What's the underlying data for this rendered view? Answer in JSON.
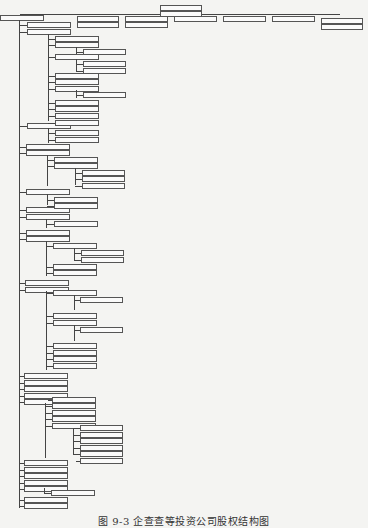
{
  "diagram": {
    "type": "tree",
    "caption": "图 9-3  企查查等投资公司股权结构图",
    "colors": {
      "line": "#444444",
      "box_border": "#555555",
      "box_fill": "#fafafa",
      "background": "#f4f4f2"
    },
    "top_row": {
      "root": {
        "x": 0,
        "y": 15,
        "w": 42
      },
      "spine": {
        "x": 20,
        "y": 14,
        "w": 320
      },
      "header_boxes": [
        {
          "x": 160,
          "y": 5,
          "w": 40
        },
        {
          "x": 160,
          "y": 11,
          "w": 40
        },
        {
          "x": 77,
          "y": 16,
          "w": 40
        },
        {
          "x": 77,
          "y": 22,
          "w": 40
        },
        {
          "x": 125,
          "y": 16,
          "w": 41
        },
        {
          "x": 125,
          "y": 22,
          "w": 41
        },
        {
          "x": 174,
          "y": 16,
          "w": 41
        },
        {
          "x": 223,
          "y": 16,
          "w": 41
        },
        {
          "x": 272,
          "y": 16,
          "w": 41
        },
        {
          "x": 321,
          "y": 18,
          "w": 40
        },
        {
          "x": 321,
          "y": 24,
          "w": 40
        }
      ]
    },
    "trunk": {
      "x": 19,
      "y1": 20,
      "y2": 508
    },
    "branches": [
      {
        "x": 27,
        "y": 22,
        "w": 42
      },
      {
        "x": 27,
        "y": 29,
        "w": 42
      },
      {
        "x": 27,
        "y": 123,
        "w": 42
      },
      {
        "x": 26,
        "y": 144,
        "w": 42
      },
      {
        "x": 26,
        "y": 150,
        "w": 42
      },
      {
        "x": 26,
        "y": 189,
        "w": 42
      },
      {
        "x": 26,
        "y": 207,
        "w": 42
      },
      {
        "x": 26,
        "y": 214,
        "w": 42
      },
      {
        "x": 26,
        "y": 230,
        "w": 42
      },
      {
        "x": 26,
        "y": 236,
        "w": 42
      },
      {
        "x": 25,
        "y": 280,
        "w": 42
      },
      {
        "x": 25,
        "y": 287,
        "w": 42
      },
      {
        "x": 24,
        "y": 373,
        "w": 42
      },
      {
        "x": 24,
        "y": 380,
        "w": 42
      },
      {
        "x": 24,
        "y": 386,
        "w": 42
      },
      {
        "x": 24,
        "y": 393,
        "w": 42
      },
      {
        "x": 24,
        "y": 399,
        "w": 42
      },
      {
        "x": 24,
        "y": 460,
        "w": 42
      },
      {
        "x": 24,
        "y": 467,
        "w": 42
      },
      {
        "x": 24,
        "y": 473,
        "w": 42
      },
      {
        "x": 24,
        "y": 480,
        "w": 42
      },
      {
        "x": 24,
        "y": 486,
        "w": 42
      },
      {
        "x": 24,
        "y": 497,
        "w": 42
      },
      {
        "x": 24,
        "y": 503,
        "w": 42
      }
    ],
    "sub_trunks": [
      {
        "x": 48,
        "y1": 34,
        "y2": 121
      },
      {
        "x": 48,
        "y1": 128,
        "y2": 143
      },
      {
        "x": 47,
        "y1": 155,
        "y2": 186
      },
      {
        "x": 47,
        "y1": 194,
        "y2": 205
      },
      {
        "x": 46,
        "y1": 219,
        "y2": 228
      },
      {
        "x": 46,
        "y1": 241,
        "y2": 276
      },
      {
        "x": 46,
        "y1": 291,
        "y2": 370
      },
      {
        "x": 45,
        "y1": 403,
        "y2": 458
      },
      {
        "x": 44,
        "y1": 488,
        "y2": 494
      }
    ],
    "level2": [
      {
        "x": 55,
        "y": 36,
        "w": 42
      },
      {
        "x": 55,
        "y": 42,
        "w": 42
      },
      {
        "x": 55,
        "y": 54,
        "w": 42
      },
      {
        "x": 55,
        "y": 73,
        "w": 42
      },
      {
        "x": 55,
        "y": 79,
        "w": 42
      },
      {
        "x": 55,
        "y": 86,
        "w": 42
      },
      {
        "x": 55,
        "y": 100,
        "w": 42
      },
      {
        "x": 55,
        "y": 106,
        "w": 42
      },
      {
        "x": 55,
        "y": 113,
        "w": 42
      },
      {
        "x": 55,
        "y": 120,
        "w": 42
      },
      {
        "x": 55,
        "y": 130,
        "w": 42
      },
      {
        "x": 55,
        "y": 137,
        "w": 42
      },
      {
        "x": 54,
        "y": 157,
        "w": 42
      },
      {
        "x": 54,
        "y": 163,
        "w": 42
      },
      {
        "x": 54,
        "y": 197,
        "w": 42
      },
      {
        "x": 54,
        "y": 203,
        "w": 42
      },
      {
        "x": 54,
        "y": 221,
        "w": 42
      },
      {
        "x": 53,
        "y": 243,
        "w": 42
      },
      {
        "x": 53,
        "y": 264,
        "w": 42
      },
      {
        "x": 53,
        "y": 270,
        "w": 42
      },
      {
        "x": 53,
        "y": 290,
        "w": 42
      },
      {
        "x": 53,
        "y": 313,
        "w": 42
      },
      {
        "x": 53,
        "y": 320,
        "w": 42
      },
      {
        "x": 53,
        "y": 343,
        "w": 42
      },
      {
        "x": 53,
        "y": 350,
        "w": 42
      },
      {
        "x": 53,
        "y": 356,
        "w": 42
      },
      {
        "x": 53,
        "y": 363,
        "w": 42
      },
      {
        "x": 52,
        "y": 397,
        "w": 42
      },
      {
        "x": 52,
        "y": 403,
        "w": 42
      },
      {
        "x": 52,
        "y": 410,
        "w": 42
      },
      {
        "x": 52,
        "y": 416,
        "w": 42
      },
      {
        "x": 52,
        "y": 423,
        "w": 42
      },
      {
        "x": 51,
        "y": 490,
        "w": 42
      }
    ],
    "level2_trunks": [
      {
        "x": 76,
        "y1": 47,
        "y2": 54
      },
      {
        "x": 76,
        "y1": 59,
        "y2": 71
      },
      {
        "x": 76,
        "y1": 90,
        "y2": 98
      },
      {
        "x": 75,
        "y1": 168,
        "y2": 185
      },
      {
        "x": 74,
        "y1": 248,
        "y2": 261
      },
      {
        "x": 74,
        "y1": 295,
        "y2": 310
      },
      {
        "x": 74,
        "y1": 325,
        "y2": 341
      },
      {
        "x": 73,
        "y1": 428,
        "y2": 454
      }
    ],
    "level3": [
      {
        "x": 83,
        "y": 49,
        "w": 41
      },
      {
        "x": 83,
        "y": 61,
        "w": 41
      },
      {
        "x": 83,
        "y": 68,
        "w": 41
      },
      {
        "x": 83,
        "y": 92,
        "w": 41
      },
      {
        "x": 82,
        "y": 170,
        "w": 41
      },
      {
        "x": 82,
        "y": 176,
        "w": 41
      },
      {
        "x": 82,
        "y": 183,
        "w": 41
      },
      {
        "x": 81,
        "y": 250,
        "w": 41
      },
      {
        "x": 81,
        "y": 257,
        "w": 41
      },
      {
        "x": 80,
        "y": 297,
        "w": 41
      },
      {
        "x": 80,
        "y": 327,
        "w": 41
      },
      {
        "x": 80,
        "y": 425,
        "w": 41
      },
      {
        "x": 80,
        "y": 432,
        "w": 41
      },
      {
        "x": 80,
        "y": 438,
        "w": 41
      },
      {
        "x": 80,
        "y": 445,
        "w": 41
      },
      {
        "x": 80,
        "y": 451,
        "w": 41
      },
      {
        "x": 80,
        "y": 458,
        "w": 41
      }
    ]
  }
}
